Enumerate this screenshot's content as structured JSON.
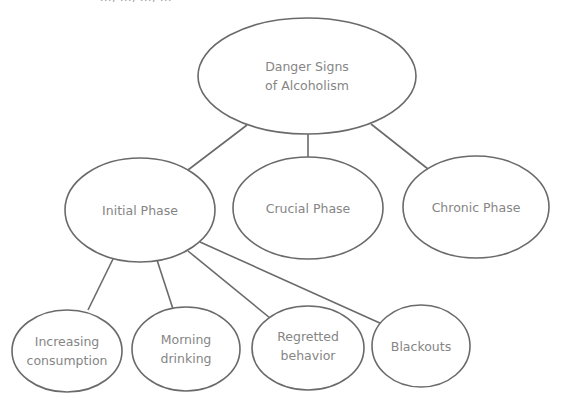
{
  "header": {
    "cutoff_text": "..., ..., ..., ..."
  },
  "diagram": {
    "type": "tree",
    "stroke_color": "#6a6a6a",
    "text_color": "#858585",
    "root": {
      "id": "root",
      "line1": "Danger Signs",
      "line2": "of Alcoholism"
    },
    "phases": [
      {
        "id": "initial",
        "label": "Initial Phase"
      },
      {
        "id": "crucial",
        "label": "Crucial Phase"
      },
      {
        "id": "chronic",
        "label": "Chronic Phase"
      }
    ],
    "initial_children": [
      {
        "id": "increasing",
        "line1": "Increasing",
        "line2": "consumption"
      },
      {
        "id": "morning",
        "line1": "Morning",
        "line2": "drinking"
      },
      {
        "id": "regretted",
        "line1": "Regretted",
        "line2": "behavior"
      },
      {
        "id": "blackouts",
        "line1": "Blackouts",
        "line2": ""
      }
    ],
    "edges": [
      [
        "root",
        "initial"
      ],
      [
        "root",
        "crucial"
      ],
      [
        "root",
        "chronic"
      ],
      [
        "initial",
        "increasing"
      ],
      [
        "initial",
        "morning"
      ],
      [
        "initial",
        "regretted"
      ],
      [
        "initial",
        "blackouts"
      ]
    ]
  }
}
